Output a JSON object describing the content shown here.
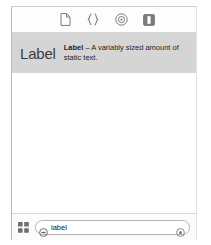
{
  "panel": {
    "title": "Library",
    "toolbar": {
      "items": [
        {
          "icon": "file-page-icon",
          "label": "File Templates",
          "selected": false
        },
        {
          "icon": "code-braces-icon",
          "label": "Code Snippets",
          "selected": false
        },
        {
          "icon": "target-circle-icon",
          "label": "Objects",
          "selected": true
        },
        {
          "icon": "media-square-icon",
          "label": "Media",
          "selected": false
        }
      ]
    },
    "results": [
      {
        "glyph": "Label",
        "name": "Label",
        "separator": "–",
        "description": "A variably sized amount of static text.",
        "selected": true
      }
    ],
    "bottom_bar": {
      "grid_icon": "grid-2x2-icon",
      "search": {
        "token_icon": "filter-token-icon",
        "value": "label",
        "placeholder": "label",
        "clear_icon": "clear-circle-icon"
      }
    }
  },
  "colors": {
    "panel_background": "#ffffff",
    "selection": "#d5d5d5",
    "toolbar_background": "#fdfdfd",
    "bottom_bar_background": "#fbfbfb",
    "border": "#d8d8d8",
    "icon": "#7b7b7b",
    "text": "#1d1d1d"
  }
}
